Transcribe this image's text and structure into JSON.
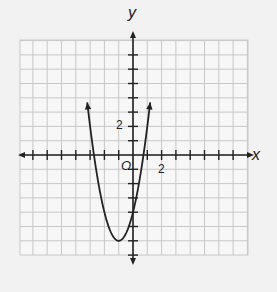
{
  "chart_data": {
    "type": "line",
    "title": "",
    "xlabel": "x",
    "ylabel": "y",
    "origin_label": "O",
    "tick_labels": {
      "x": [
        "2"
      ],
      "y": [
        "2"
      ]
    },
    "xlim": [
      -8,
      8
    ],
    "ylim": [
      -8,
      8
    ],
    "grid": true,
    "series": [
      {
        "name": "parabola",
        "equation": "y = 2x^2 + 4x - 4",
        "vertex": [
          -1,
          -6
        ],
        "y_intercept": -4,
        "x_intercepts": [
          -2.73,
          0.73
        ],
        "x": [
          -3.2,
          -3,
          -2.5,
          -2,
          -1.5,
          -1,
          -0.5,
          0,
          0.5,
          1,
          1.2
        ],
        "y": [
          3.68,
          2,
          -1.5,
          -4,
          -5.5,
          -6,
          -5.5,
          -4,
          -1.5,
          2,
          3.68
        ]
      }
    ]
  }
}
